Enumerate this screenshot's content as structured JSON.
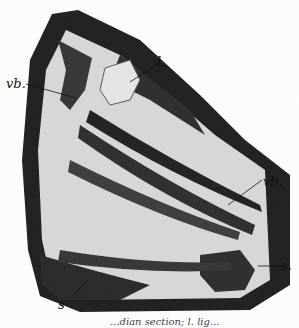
{
  "figure": {
    "labels": {
      "l": "l.",
      "vb_left": "vb.",
      "vb_right": "vb.",
      "s_right": "s.",
      "s_left": "s"
    },
    "caption_fragment": "...dian section; l. lig..."
  }
}
